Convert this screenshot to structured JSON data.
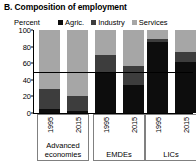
{
  "title": "B. Composition of employment",
  "axis": {
    "unit_label": "Percent",
    "ticks": [
      "100",
      "80",
      "60",
      "40",
      "20",
      "0"
    ]
  },
  "legend": {
    "items": [
      {
        "label": "Agric.",
        "color": "#0d0d0d"
      },
      {
        "label": "Industry",
        "color": "#3d3d3d"
      },
      {
        "label": "Services",
        "color": "#a6a6a6"
      }
    ]
  },
  "groups": [
    {
      "label": "Advanced\neconomies",
      "years": [
        "1995",
        "2015"
      ]
    },
    {
      "label": "EMDEs",
      "years": [
        "1995",
        "2015"
      ]
    },
    {
      "label": "LICs",
      "years": [
        "1995",
        "2015"
      ]
    }
  ],
  "chart_data": {
    "type": "bar",
    "title": "B. Composition of employment",
    "xlabel": "",
    "ylabel": "Percent",
    "ylim": [
      0,
      100
    ],
    "grid": false,
    "stacked": true,
    "legend_position": "top",
    "categories": [
      "Advanced economies 1995",
      "Advanced economies 2015",
      "EMDEs 1995",
      "EMDEs 2015",
      "LICs 1995",
      "LICs 2015"
    ],
    "series": [
      {
        "name": "Agric.",
        "color": "#0d0d0d",
        "values": [
          5,
          3,
          50,
          34,
          85,
          62
        ]
      },
      {
        "name": "Industry",
        "color": "#3d3d3d",
        "values": [
          24,
          18,
          20,
          23,
          4,
          12
        ]
      },
      {
        "name": "Services",
        "color": "#a6a6a6",
        "values": [
          71,
          79,
          30,
          43,
          11,
          26
        ]
      }
    ],
    "annotations": [
      {
        "type": "hline",
        "value": 50,
        "color": "#000000"
      }
    ]
  }
}
